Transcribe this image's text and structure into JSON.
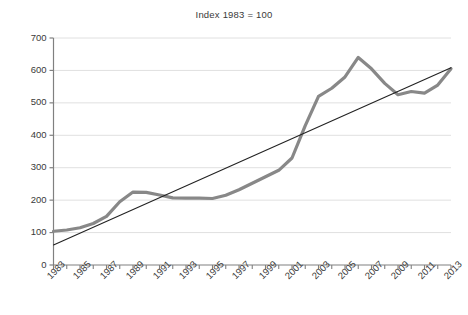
{
  "chart_data": {
    "type": "line",
    "title": "Index 1983 = 100",
    "xlabel": "",
    "ylabel": "",
    "xlim": [
      1983,
      2013
    ],
    "ylim": [
      0,
      700
    ],
    "grid": true,
    "legend": false,
    "y_ticks": [
      0,
      100,
      200,
      300,
      400,
      500,
      600,
      700
    ],
    "x_ticks": [
      1983,
      1985,
      1987,
      1989,
      1991,
      1993,
      1995,
      1997,
      1999,
      2001,
      2003,
      2005,
      2007,
      2009,
      2011,
      2013
    ],
    "x_tick_labels": [
      "1983",
      "1985",
      "1987",
      "1989",
      "1991",
      "1993",
      "1995",
      "1997",
      "1999",
      "2001",
      "2003",
      "2005",
      "2007",
      "2009",
      "2011",
      "2013"
    ],
    "x_minor_ticks": [
      1984,
      1986,
      1988,
      1990,
      1992,
      1994,
      1996,
      1998,
      2000,
      2002,
      2004,
      2006,
      2008,
      2010,
      2012
    ],
    "series": [
      {
        "name": "Index",
        "style": "thick-gray-line",
        "color": "#888888",
        "x": [
          1983,
          1984,
          1985,
          1986,
          1987,
          1988,
          1989,
          1990,
          1991,
          1992,
          1993,
          1994,
          1995,
          1996,
          1997,
          1998,
          1999,
          2000,
          2001,
          2002,
          2003,
          2004,
          2005,
          2006,
          2007,
          2008,
          2009,
          2010,
          2011,
          2012,
          2013
        ],
        "values": [
          104,
          108,
          115,
          128,
          150,
          195,
          225,
          224,
          216,
          207,
          206,
          206,
          205,
          215,
          232,
          252,
          272,
          292,
          330,
          430,
          520,
          545,
          580,
          640,
          605,
          560,
          525,
          535,
          530,
          555,
          605
        ]
      },
      {
        "name": "Trend",
        "style": "thin-black-line",
        "color": "#222222",
        "x": [
          1983,
          2013
        ],
        "values": [
          62,
          608
        ]
      }
    ],
    "axis_color": "#808080",
    "grid_color": "#e0e0e0",
    "text_color": "#3a3a3a"
  }
}
